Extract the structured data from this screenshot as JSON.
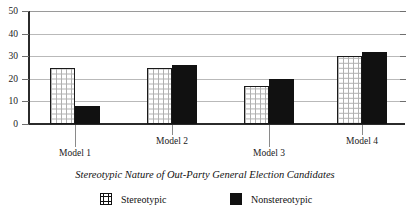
{
  "chart_data": {
    "type": "bar",
    "title": "",
    "xlabel": "Stereotypic Nature of Out-Party General Election Candidates",
    "ylabel": "",
    "categories": [
      "Model 1",
      "Model 2",
      "Model 3",
      "Model 4"
    ],
    "series": [
      {
        "name": "Stereotypic",
        "values": [
          25,
          25,
          17,
          30
        ],
        "color": "#ffffff",
        "pattern": "grid-hatch"
      },
      {
        "name": "Nonstereotypic",
        "values": [
          8,
          26,
          20,
          32
        ],
        "color": "#111111",
        "pattern": "solid"
      }
    ],
    "ylim": [
      0,
      50
    ],
    "yticks": [
      0,
      10,
      20,
      30,
      40,
      50
    ],
    "ytick_labels": [
      "0",
      "10",
      "20",
      "30",
      "40",
      "50"
    ],
    "grid": true,
    "grid_axis": "y",
    "legend_position": "bottom",
    "legend_entries": [
      "Stereotypic",
      "Nonstereotypic"
    ]
  }
}
